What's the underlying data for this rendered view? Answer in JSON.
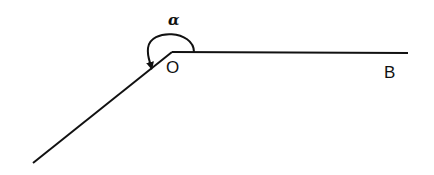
{
  "diagram": {
    "type": "angle",
    "vertex": {
      "label": "O",
      "x": 172,
      "y": 52
    },
    "ray_right": {
      "label": "B",
      "end_x": 408,
      "end_y": 53
    },
    "ray_lower_left": {
      "end_x": 33,
      "end_y": 163
    },
    "angle_label": "α",
    "colors": {
      "stroke": "#111111",
      "background": "#ffffff"
    }
  }
}
